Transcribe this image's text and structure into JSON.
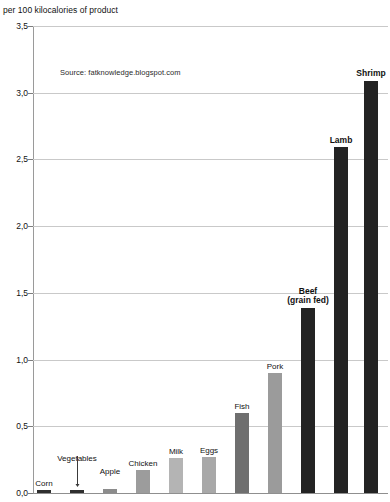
{
  "title": {
    "clipped_top_line": "",
    "line": "per 100 kilocalories of product"
  },
  "source": {
    "text": "Source: fatknowledge.blogspot.com"
  },
  "axis": {
    "y_tick_labels": [
      "3,5",
      "3,0",
      "2,5",
      "2,0",
      "1,5",
      "1,0",
      "0,5",
      "0,0"
    ]
  },
  "chart_data": {
    "type": "bar",
    "title": "per 100 kilocalories of product",
    "xlabel": "",
    "ylabel": "",
    "ylim": [
      0.0,
      3.5
    ],
    "ytick_values": [
      0.0,
      0.5,
      1.0,
      1.5,
      2.0,
      2.5,
      3.0,
      3.5
    ],
    "ytick_labels": [
      "0,0",
      "0,5",
      "1,0",
      "1,5",
      "2,0",
      "2,5",
      "3,0",
      "3,5"
    ],
    "decimal_separator": ",",
    "grid": "horizontal",
    "legend": "none",
    "annotations": [
      "Source: fatknowledge.blogspot.com"
    ],
    "categories": [
      "Corn",
      "Vegetables",
      "Apple",
      "Chicken",
      "Milk",
      "Eggs",
      "Fish",
      "Pork",
      "Beef (grain fed)",
      "Lamb",
      "Shrimp"
    ],
    "values": [
      0.02,
      0.02,
      0.03,
      0.17,
      0.26,
      0.27,
      0.6,
      0.9,
      1.39,
      2.59,
      3.09
    ],
    "bar_colors": [
      "#2f2f2f",
      "#2f2f2f",
      "#8c8c8c",
      "#9c9c9c",
      "#b4b4b4",
      "#a8a8a8",
      "#6f6f6f",
      "#9b9b9b",
      "#232323",
      "#232323",
      "#232323"
    ],
    "bars": [
      {
        "label": "Corn",
        "value": 0.02,
        "color": "#2f2f2f",
        "bold": false,
        "label_offset": -11,
        "leader": false
      },
      {
        "label": "Vegetables",
        "value": 0.02,
        "color": "#2f2f2f",
        "bold": false,
        "label_offset": -36,
        "leader": true
      },
      {
        "label": "Apple",
        "value": 0.03,
        "color": "#8c8c8c",
        "bold": false,
        "label_offset": -22,
        "leader": false
      },
      {
        "label": "Chicken",
        "value": 0.17,
        "color": "#9c9c9c",
        "bold": false,
        "label_offset": -11,
        "leader": false
      },
      {
        "label": "Milk",
        "value": 0.26,
        "color": "#b4b4b4",
        "bold": false,
        "label_offset": -11,
        "leader": false
      },
      {
        "label": "Eggs",
        "value": 0.27,
        "color": "#a8a8a8",
        "bold": false,
        "label_offset": -11,
        "leader": false
      },
      {
        "label": "Fish",
        "value": 0.6,
        "color": "#6f6f6f",
        "bold": false,
        "label_offset": -11,
        "leader": false
      },
      {
        "label": "Pork",
        "value": 0.9,
        "color": "#9b9b9b",
        "bold": false,
        "label_offset": -11,
        "leader": false
      },
      {
        "label": "Beef\n(grain fed)",
        "value": 1.39,
        "color": "#232323",
        "bold": true,
        "label_offset": -11,
        "leader": false
      },
      {
        "label": "Lamb",
        "value": 2.59,
        "color": "#232323",
        "bold": true,
        "label_offset": -11,
        "leader": false
      },
      {
        "label": "Shrimp",
        "value": 3.09,
        "color": "#232323",
        "bold": true,
        "label_offset": -11,
        "leader": false
      }
    ]
  },
  "layout": {
    "plot_left": 33,
    "plot_top": 26,
    "plot_width": 355,
    "plot_height": 467,
    "bar_centers": [
      44,
      77,
      110,
      143,
      176,
      209,
      242,
      275,
      308,
      341,
      371
    ],
    "bar_width": 14,
    "thin_bar_width": 14
  },
  "colors": {
    "gridline": "#c9c9c9",
    "axis": "#8f8f8f",
    "text": "#111111",
    "background": "#ffffff"
  }
}
